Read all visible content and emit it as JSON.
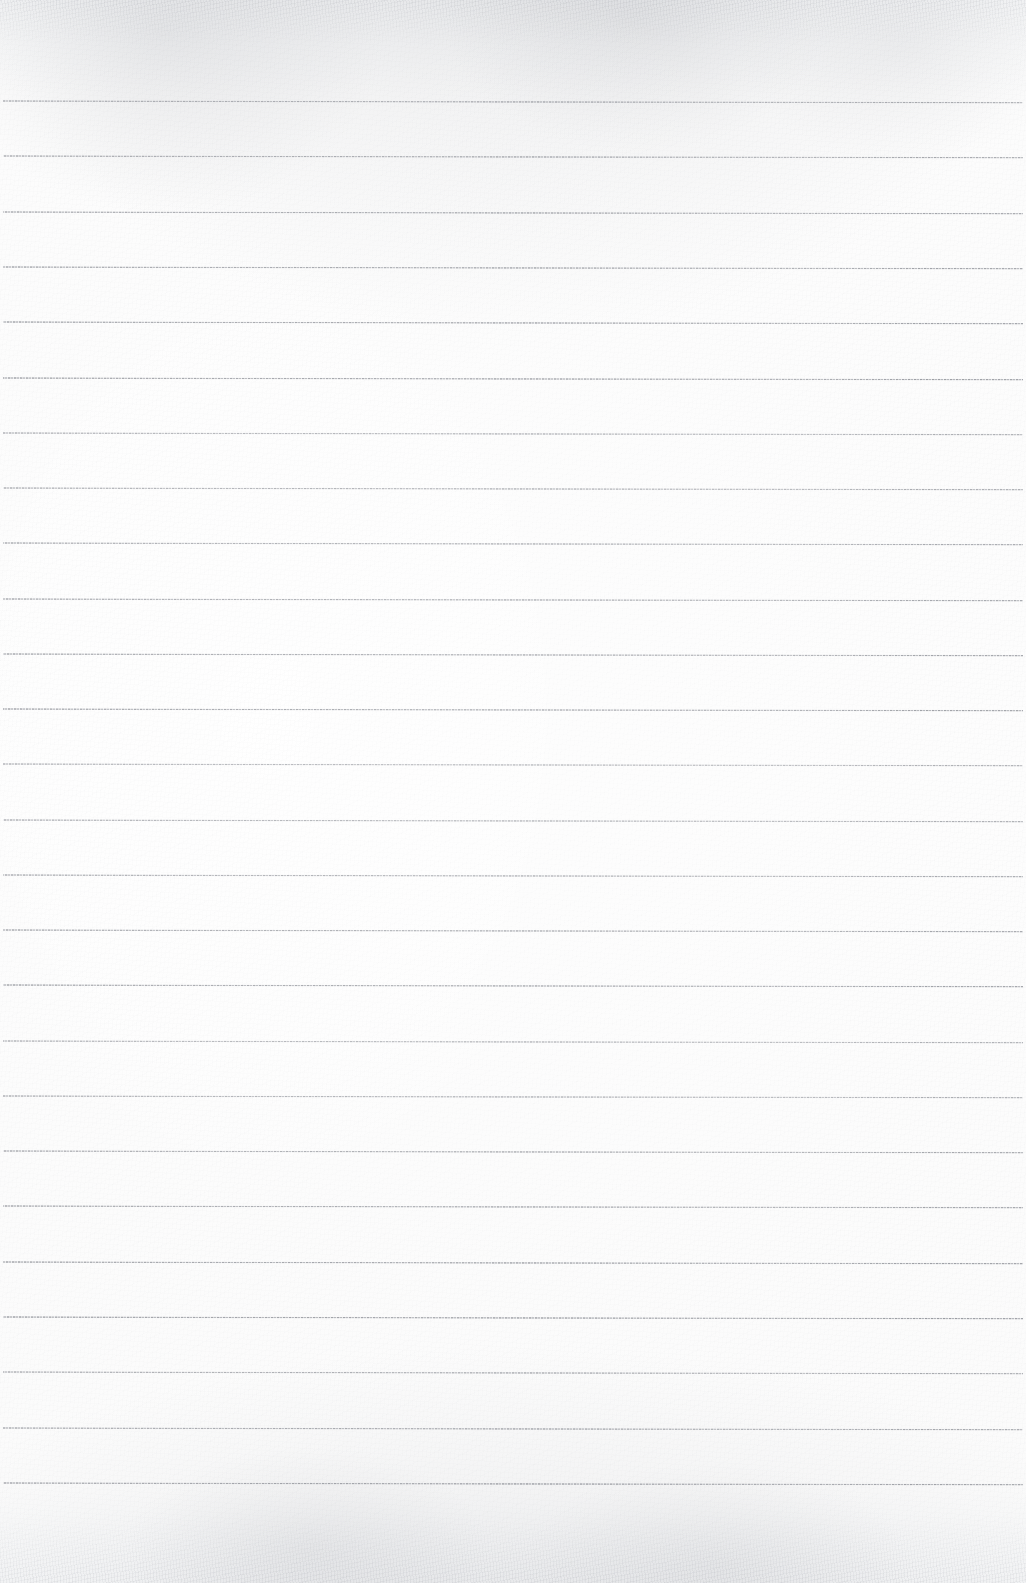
{
  "document": {
    "kind": "scanned-ruled-notebook-page",
    "title": "Blank Ruled Paper",
    "page_width": 1026,
    "page_height": 1583,
    "text_content": "",
    "handwriting_present": false,
    "printed_text_present": false,
    "has_margin_rule": false,
    "has_holes": false
  },
  "colors": {
    "paper": "#fbfbfb",
    "paper_edge_shade": "#f1f2f4",
    "rule_line": "#7a7d85",
    "rule_line_light": "#b0b3ba"
  },
  "ruling": {
    "line_count": 26,
    "first_line_y": 101,
    "line_spacing": 55.3,
    "line_start_x": 3,
    "line_end_x": 1023,
    "line_thickness": 1,
    "skew_degrees": 0.1,
    "top_margin": 101,
    "bottom_margin": 100,
    "lines_y": [
      101,
      156,
      212,
      267,
      322,
      378,
      433,
      488,
      543,
      599,
      654,
      709,
      764,
      820,
      875,
      930,
      985,
      1041,
      1096,
      1151,
      1206,
      1262,
      1317,
      1372,
      1428,
      1483
    ]
  },
  "regions": {
    "top_edge_band_height": 46,
    "bottom_edge_band_height": 72
  }
}
